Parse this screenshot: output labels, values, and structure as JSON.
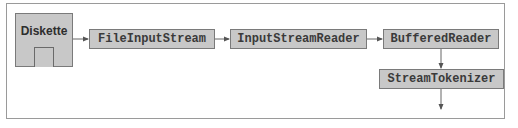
{
  "diagram": {
    "source": {
      "label": "Diskette",
      "icon": "diskette-icon"
    },
    "nodes": [
      {
        "id": "file-input-stream",
        "label": "FileInputStream"
      },
      {
        "id": "input-stream-reader",
        "label": "InputStreamReader"
      },
      {
        "id": "buffered-reader",
        "label": "BufferedReader"
      },
      {
        "id": "stream-tokenizer",
        "label": "StreamTokenizer"
      }
    ],
    "edges": [
      {
        "from": "Diskette",
        "to": "FileInputStream"
      },
      {
        "from": "FileInputStream",
        "to": "InputStreamReader"
      },
      {
        "from": "InputStreamReader",
        "to": "BufferedReader"
      },
      {
        "from": "BufferedReader",
        "to": "StreamTokenizer"
      },
      {
        "from": "StreamTokenizer",
        "to": "output"
      }
    ],
    "colors": {
      "node_fill": "#c8c8c8",
      "node_border": "#7a7a7a",
      "text": "#3a3a3a",
      "frame": "#9a9a9a"
    }
  }
}
